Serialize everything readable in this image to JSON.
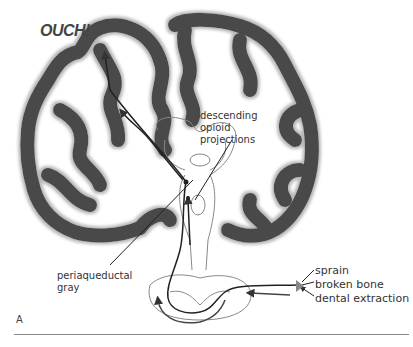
{
  "figure": {
    "panel_label": "A",
    "exclamation": "OUCH!",
    "labels": {
      "descending": [
        "descending",
        "opioid",
        "projections"
      ],
      "periaqueductal": [
        "periaqueductal",
        "gray"
      ],
      "stimuli": [
        "sprain",
        "broken bone",
        "dental extraction"
      ]
    },
    "colors": {
      "cortex": "#4a4a4a",
      "cortex_halo": "#b8b8b8",
      "outline": "#888888",
      "pathway": "#222222"
    }
  }
}
